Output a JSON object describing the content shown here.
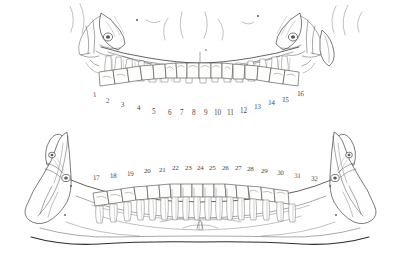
{
  "figure": {
    "style": "pen-and-ink anatomical line drawing",
    "background_color": "#ffffff",
    "ink_color": "#4a4744"
  },
  "upper_arch": {
    "name": "maxillary-arch",
    "label": "Maxilla (upper jaw)",
    "tooth_count": 16,
    "numbers": [
      "1",
      "2",
      "3",
      "4",
      "5",
      "6",
      "7",
      "8",
      "9",
      "10",
      "11",
      "12",
      "13",
      "14",
      "15",
      "16"
    ],
    "number_positions": [
      {
        "label": "1",
        "x": 93,
        "y": 94
      },
      {
        "label": "2",
        "x": 107,
        "y": 100
      },
      {
        "label": "3",
        "x": 123,
        "y": 104
      },
      {
        "label": "4",
        "x": 139,
        "y": 107
      },
      {
        "label": "5",
        "x": 155,
        "y": 110
      },
      {
        "label": "6",
        "x": 170,
        "y": 112
      },
      {
        "label": "7",
        "x": 182,
        "y": 112
      },
      {
        "label": "8",
        "x": 194,
        "y": 112
      },
      {
        "label": "9",
        "x": 206,
        "y": 112
      },
      {
        "label": "10",
        "x": 216,
        "y": 112
      },
      {
        "label": "11",
        "x": 229,
        "y": 112
      },
      {
        "label": "12",
        "x": 243,
        "y": 110
      },
      {
        "label": "13",
        "x": 257,
        "y": 106
      },
      {
        "label": "14",
        "x": 271,
        "y": 102
      },
      {
        "label": "15",
        "x": 285,
        "y": 99
      },
      {
        "label": "16",
        "x": 300,
        "y": 93
      }
    ]
  },
  "lower_arch": {
    "name": "mandibular-arch",
    "label": "Mandible (lower jaw)",
    "tooth_count": 16,
    "numbers": [
      "17",
      "18",
      "19",
      "20",
      "21",
      "22",
      "23",
      "24",
      "25",
      "26",
      "27",
      "28",
      "29",
      "30",
      "31",
      "32"
    ],
    "number_positions": [
      {
        "label": "17",
        "x": 96,
        "y": 177
      },
      {
        "label": "18",
        "x": 113,
        "y": 175
      },
      {
        "label": "19",
        "x": 130,
        "y": 173
      },
      {
        "label": "20",
        "x": 148,
        "y": 170
      },
      {
        "label": "21",
        "x": 163,
        "y": 169
      },
      {
        "label": "22",
        "x": 176,
        "y": 167
      },
      {
        "label": "23",
        "x": 189,
        "y": 167
      },
      {
        "label": "24",
        "x": 201,
        "y": 167
      },
      {
        "label": "25",
        "x": 213,
        "y": 167
      },
      {
        "label": "26",
        "x": 226,
        "y": 167
      },
      {
        "label": "27",
        "x": 239,
        "y": 167
      },
      {
        "label": "28",
        "x": 251,
        "y": 168
      },
      {
        "label": "29",
        "x": 265,
        "y": 170
      },
      {
        "label": "30",
        "x": 281,
        "y": 172
      },
      {
        "label": "31",
        "x": 298,
        "y": 175
      },
      {
        "label": "32",
        "x": 315,
        "y": 178
      }
    ]
  }
}
